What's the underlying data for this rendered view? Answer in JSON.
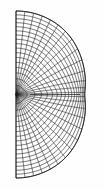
{
  "figure": {
    "title": "Conformal mapping grid on a half-disk with a horizontal slit",
    "type": "mathematical-diagram",
    "background_color": "#fefefe",
    "line_color": "#1b1b1b",
    "boundary_color": "#111111"
  },
  "geometry": {
    "canvas_width": 104,
    "canvas_height": 189,
    "straight_edge_x": 16,
    "top_y": 11,
    "bottom_y": 178,
    "center_y": 94.5,
    "rightmost_x": 92.5,
    "focus_x": 80.0,
    "focus_y": 94.5,
    "slit_start_x": 30.0,
    "slit_end_x": 80.0,
    "radial_count": 27,
    "arc_count": 17
  },
  "chart_data": {
    "type": "line",
    "title": "Conformal mapping grid on a half-disk with a horizontal slit",
    "xlabel": "",
    "ylabel": "",
    "xlim": [
      16,
      93
    ],
    "ylim": [
      11,
      178
    ],
    "grid": true,
    "legend": "none",
    "series": [
      {
        "name": "family-u (lines from straight edge to arc)",
        "count": 27
      },
      {
        "name": "family-v (lines parallel to the arc)",
        "count": 17
      }
    ],
    "annotations": [
      {
        "label": "focal point (singularity)",
        "x": 80.0,
        "y": 94.5
      },
      {
        "label": "slit",
        "x0": 30.0,
        "y0": 94.5,
        "x1": 80.0,
        "y1": 94.5
      }
    ]
  },
  "labels": {
    "figure_caption": ""
  }
}
